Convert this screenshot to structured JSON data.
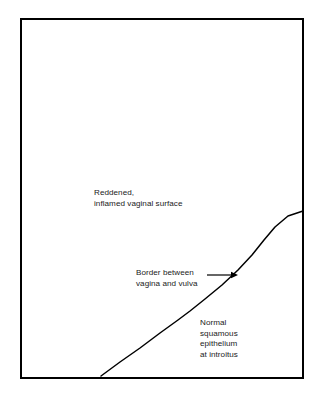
{
  "figure": {
    "type": "medical-illustration-line-diagram",
    "background_color": "#ffffff",
    "line_color": "#000000",
    "text_color": "#1a1a1a",
    "frame": {
      "name": "rectangular-border",
      "left": 21,
      "top": 19,
      "right": 303,
      "bottom": 378,
      "stroke_width": 1.6
    },
    "boundary_curve": {
      "name": "vagina-vulva-boundary-line",
      "description": "Diagonal curved line rising from bottom-left to the right frame edge, dividing reddened inflamed vaginal surface above-left from normal squamous epithelium below-right",
      "stroke_width": 1.5,
      "points": [
        [
          101,
          376
        ],
        [
          120,
          362
        ],
        [
          140,
          348
        ],
        [
          160,
          333
        ],
        [
          178,
          320
        ],
        [
          190,
          311
        ],
        [
          205,
          299
        ],
        [
          222,
          285
        ],
        [
          238,
          270
        ],
        [
          252,
          255
        ],
        [
          264,
          240
        ],
        [
          275,
          227
        ],
        [
          288,
          216
        ],
        [
          303,
          211
        ]
      ]
    },
    "arrow": {
      "name": "pointer-arrow-to-boundary",
      "direction": "right",
      "shaft_start_x": 207,
      "shaft_end_x": 232,
      "tip_x": 238,
      "y": 275,
      "stroke_width": 1.2,
      "head_length": 7,
      "head_half_height": 3.2
    },
    "labels": {
      "reddened": {
        "name": "label-reddened-inflamed-vaginal-surface",
        "lines": [
          "Reddened,",
          "inflamed vaginal surface"
        ],
        "text": "Reddened,\ninflamed vaginal surface",
        "x": 94,
        "y": 188,
        "align": "left"
      },
      "border": {
        "name": "label-border-between-vagina-and-vulva",
        "lines": [
          "Border between",
          "vagina and vulva"
        ],
        "text": "Border between\nvagina and vulva",
        "x": 136,
        "y": 268,
        "align": "left"
      },
      "normal": {
        "name": "label-normal-squamous-epithelium-at-introitus",
        "lines": [
          "Normal",
          "squamous",
          "epithelium",
          "at introitus"
        ],
        "text": "Normal\nsquamous\nepithelium\nat introitus",
        "x": 200,
        "y": 318,
        "align": "left"
      }
    }
  }
}
